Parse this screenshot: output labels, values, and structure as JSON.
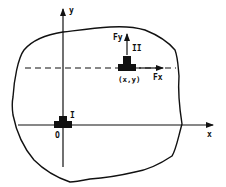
{
  "diagram": {
    "type": "free-body region with coordinate axes",
    "axes": {
      "x_label": "x",
      "y_label": "y",
      "origin_label": "O"
    },
    "elements": [
      {
        "id": "I",
        "label": "I",
        "position": "origin"
      },
      {
        "id": "II",
        "label": "II",
        "position_label": "(x,y)"
      }
    ],
    "forces": [
      {
        "label": "Fy",
        "direction": "up",
        "on": "II"
      },
      {
        "label": "Fx",
        "direction": "right",
        "on": "II"
      }
    ],
    "colors": {
      "ink": "#111111",
      "background": "#ffffff"
    }
  }
}
